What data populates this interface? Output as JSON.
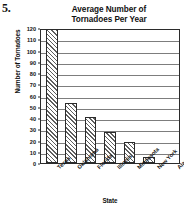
{
  "problem_number": "5.",
  "chart_data": {
    "type": "bar",
    "title": "Average Number of Tornadoes Per Year",
    "title_line1": "Average Number of",
    "title_line2": "Tornadoes Per Year",
    "xlabel": "State",
    "ylabel": "Number of Tornadoes",
    "categories": [
      "Texas",
      "Oklahoma",
      "Florida",
      "Illinois",
      "Minnesota",
      "New York",
      "Alaska"
    ],
    "values": [
      120,
      53,
      41,
      28,
      19,
      5,
      0
    ],
    "ylim": [
      0,
      120
    ],
    "ytick_step": 10,
    "yticks": [
      120,
      110,
      100,
      90,
      80,
      70,
      60,
      50,
      40,
      30,
      20,
      10,
      0
    ],
    "ytick_labels": [
      "120",
      "110",
      "100",
      "90",
      "80",
      "70",
      "60",
      "50",
      "40",
      "30",
      "20",
      "10",
      "0"
    ],
    "grid": true,
    "grid_axis": "y",
    "legend": false,
    "bar_fill": "diagonal-hatch",
    "bar_edge_color": "#2b2b2b",
    "frame_color": "#2b2b2b",
    "gridline_color": "#7d7d7d",
    "background_color": "#ffffff",
    "text_color": "#111111",
    "xtick_rotation": -45
  }
}
